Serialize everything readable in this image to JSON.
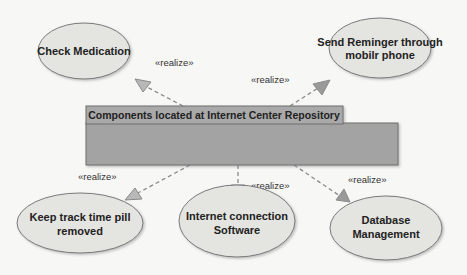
{
  "diagram": {
    "type": "UML use case / component realization",
    "colors": {
      "background": "#f7f7f5",
      "ellipse_fill": "#e4e4e0",
      "ellipse_stroke": "#7a7a7a",
      "box_header_fill": "#a8a8a8",
      "box_body_fill": "#a3a3a3",
      "box_stroke": "#6e6e6e",
      "arrow_stroke": "#8a8a8a",
      "arrow_head_fill": "#b5b5b5"
    },
    "component": {
      "title": "Components located at Internet Center Repository"
    },
    "use_cases": [
      {
        "id": "check-medication",
        "line1": "Check Medication",
        "line2": ""
      },
      {
        "id": "send-reminder",
        "line1": "Send Reminger through",
        "line2": "mobilr phone"
      },
      {
        "id": "keep-track",
        "line1": "Keep track time pill",
        "line2": "removed"
      },
      {
        "id": "internet-connection",
        "line1": "Internet connection",
        "line2": "Software"
      },
      {
        "id": "database-management",
        "line1": "Database",
        "line2": "Management"
      }
    ],
    "relations": [
      {
        "from": "component",
        "to": "check-medication",
        "label": "«realize»"
      },
      {
        "from": "component",
        "to": "send-reminder",
        "label": "«realize»"
      },
      {
        "from": "component",
        "to": "keep-track",
        "label": "«realize»"
      },
      {
        "from": "component",
        "to": "internet-connection",
        "label": "«realize»"
      },
      {
        "from": "component",
        "to": "database-management",
        "label": "«realize»"
      }
    ]
  }
}
